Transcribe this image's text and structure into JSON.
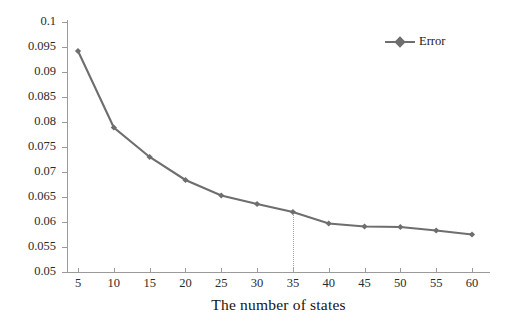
{
  "chart_data": {
    "type": "line",
    "title": "",
    "subtitle": "",
    "xlabel": "The number of states",
    "ylabel": "",
    "x": [
      5,
      10,
      15,
      20,
      25,
      30,
      35,
      40,
      45,
      50,
      55,
      60
    ],
    "series": [
      {
        "name": "Error",
        "values": [
          0.0942,
          0.0789,
          0.073,
          0.0684,
          0.0653,
          0.0636,
          0.062,
          0.0597,
          0.0591,
          0.059,
          0.0583,
          0.0575
        ],
        "color": "#6e6e6e",
        "marker": "diamond"
      }
    ],
    "xlim": [
      5,
      60
    ],
    "ylim": [
      0.05,
      0.1
    ],
    "x_ticks": [
      "5",
      "10",
      "15",
      "20",
      "25",
      "30",
      "35",
      "40",
      "45",
      "50",
      "55",
      "60"
    ],
    "y_ticks": [
      "0.05",
      "0.055",
      "0.06",
      "0.065",
      "0.07",
      "0.075",
      "0.08",
      "0.085",
      "0.09",
      "0.095",
      "0.1"
    ],
    "y_tick_values": [
      0.05,
      0.055,
      0.06,
      0.065,
      0.07,
      0.075,
      0.08,
      0.085,
      0.09,
      0.095,
      0.1
    ],
    "grid": false,
    "legend": {
      "position": "top-right",
      "entries": [
        "Error"
      ],
      "symbol": "line-with-diamond-marker"
    },
    "annotations": [
      {
        "type": "vertical-dotted-line",
        "at_x": 35,
        "from_y": 0.062,
        "to_y": 0.05,
        "color": "#a6a6a6"
      }
    ],
    "background_color": "#ffffff",
    "axis_color": "#9a9a9a"
  },
  "legend": {
    "error_label": "Error"
  },
  "axes": {
    "x_title": "The number of states"
  }
}
